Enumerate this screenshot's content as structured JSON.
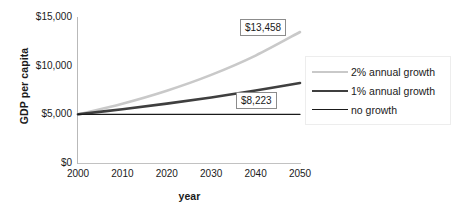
{
  "chart_data": {
    "type": "line",
    "title": "",
    "xlabel": "year",
    "ylabel": "GDP per capita",
    "xlim": [
      2000,
      2050
    ],
    "ylim": [
      0,
      15000
    ],
    "grid": false,
    "legend_position": "right",
    "x": [
      2000,
      2010,
      2020,
      2030,
      2040,
      2050
    ],
    "xtick_labels": [
      "2000",
      "2010",
      "2020",
      "2030",
      "2040",
      "2050"
    ],
    "ytick_values": [
      0,
      5000,
      10000,
      15000
    ],
    "ytick_labels": [
      "$0",
      "$5,000",
      "$10,000",
      "$15,000"
    ],
    "series": [
      {
        "name": "2% annual growth",
        "color": "#c9c9c9",
        "width": 2.6,
        "values": [
          5000,
          6095,
          7430,
          9055,
          11038,
          13458
        ],
        "end_label": "$13,458"
      },
      {
        "name": "1% annual growth",
        "color": "#3f3f3f",
        "width": 2.6,
        "values": [
          5000,
          5523,
          6100,
          6737,
          7441,
          8223
        ],
        "end_label": "$8,223"
      },
      {
        "name": "no growth",
        "color": "#1a1a1a",
        "width": 1.4,
        "values": [
          5000,
          5000,
          5000,
          5000,
          5000,
          5000
        ],
        "end_label": ""
      }
    ],
    "annotations": [
      {
        "text": "$13,458",
        "series": "2% annual growth"
      },
      {
        "text": "$8,223",
        "series": "1% annual growth"
      }
    ]
  },
  "legend": {
    "items": [
      {
        "label": "2% annual growth"
      },
      {
        "label": "1% annual growth"
      },
      {
        "label": "no growth"
      }
    ]
  }
}
